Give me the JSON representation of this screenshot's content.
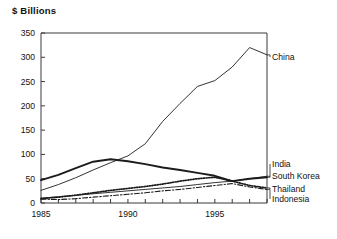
{
  "header": {
    "axis_title": "$ Billions"
  },
  "chart_data": {
    "type": "line",
    "title": "",
    "subtitle": "",
    "xlabel": "",
    "ylabel": "$ Billions",
    "xlim": [
      1985,
      1998
    ],
    "ylim": [
      0,
      350
    ],
    "ytick_labels": [
      "0",
      "50",
      "100",
      "150",
      "200",
      "250",
      "300",
      "350"
    ],
    "ytick_values": [
      0,
      50,
      100,
      150,
      200,
      250,
      300,
      350
    ],
    "xtick_labels": [
      "1985",
      "1990",
      "1995"
    ],
    "xtick_values": [
      1985,
      1990,
      1995
    ],
    "x_minor_tick_step": 1,
    "grid": false,
    "legend_position": "right-inline-labels",
    "x": [
      1985,
      1986,
      1987,
      1988,
      1989,
      1990,
      1991,
      1992,
      1993,
      1994,
      1995,
      1996,
      1997,
      1998
    ],
    "series": [
      {
        "name": "China",
        "label": "China",
        "style": "solid-thin",
        "values": [
          26,
          38,
          52,
          68,
          83,
          97,
          122,
          168,
          205,
          240,
          252,
          280,
          320,
          305
        ]
      },
      {
        "name": "South Korea",
        "label": "South Korea",
        "style": "solid-thick",
        "values": [
          47,
          58,
          72,
          85,
          90,
          86,
          80,
          73,
          68,
          62,
          56,
          45,
          50,
          53
        ]
      },
      {
        "name": "India",
        "label": "India",
        "style": "solid-thin",
        "values": [
          10,
          13,
          16,
          19,
          22,
          25,
          28,
          31,
          34,
          38,
          42,
          45,
          50,
          55
        ]
      },
      {
        "name": "Thailand",
        "label": "Thailand",
        "style": "dotted",
        "values": [
          9,
          12,
          16,
          21,
          26,
          30,
          34,
          39,
          45,
          50,
          53,
          45,
          36,
          31
        ]
      },
      {
        "name": "Indonesia",
        "label": "Indonesia",
        "style": "dash-dot",
        "values": [
          8,
          7,
          9,
          12,
          15,
          18,
          21,
          25,
          28,
          32,
          36,
          40,
          33,
          28
        ]
      }
    ],
    "colors": {
      "line": "#1c1c1c",
      "axis": "#3a3a3a",
      "background": "#ffffff"
    }
  }
}
